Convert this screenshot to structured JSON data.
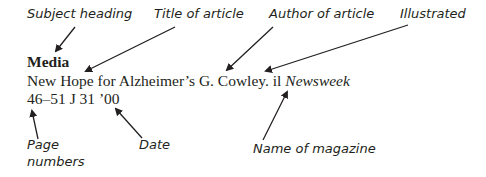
{
  "labels": {
    "subject_heading": "Subject heading",
    "title_of_article": "Title of article",
    "author_of_article": "Author of article",
    "illustrated": "Illustrated",
    "page_numbers_line1": "Page",
    "page_numbers_line2": "numbers",
    "date": "Date",
    "name_of_magazine": "Name of magazine"
  },
  "entry": {
    "subject": "Media",
    "title": "New Hope for Alzheimer’s",
    "author": "G. Cowley.",
    "illustrated_abbrev": "il",
    "magazine": "Newsweek",
    "pages": "46–51",
    "date": "J 31 ’00"
  },
  "colors": {
    "text": "#231f20",
    "background": "#ffffff"
  }
}
